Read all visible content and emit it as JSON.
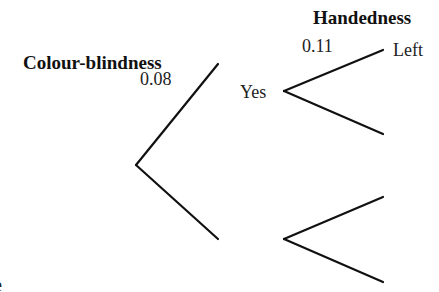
{
  "diagram": {
    "type": "probability tree",
    "stage_headers": {
      "stage1": "Colour-blindness",
      "stage2": "Handedness"
    },
    "branches": {
      "stage1": [
        {
          "outcome": "Yes",
          "probability": "0.08"
        },
        {
          "outcome": "",
          "probability": ""
        }
      ],
      "stage2_after_yes": [
        {
          "outcome": "Left",
          "probability": "0.11"
        },
        {
          "outcome": "",
          "probability": ""
        }
      ],
      "stage2_after_no": [
        {
          "outcome": "",
          "probability": ""
        },
        {
          "outcome": "",
          "probability": ""
        }
      ]
    },
    "cropped_glyph": "e"
  }
}
